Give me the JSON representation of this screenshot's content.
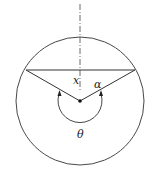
{
  "diagram": {
    "labels": {
      "x": "x",
      "alpha": "α",
      "theta": "θ"
    },
    "colors": {
      "stroke": "#333333",
      "background": "#ffffff"
    },
    "geometry": {
      "circle": {
        "cx": 80,
        "cy": 101,
        "r": 64
      },
      "chord": {
        "x1": 26,
        "y1": 70,
        "x2": 135,
        "y2": 70
      },
      "center_point": {
        "x": 80,
        "y": 101
      },
      "axis": {
        "x": 80,
        "y1": 4,
        "y2": 92
      },
      "theta_arc": {
        "start": [
          59,
          94
        ],
        "end": [
          101,
          94
        ],
        "radius": 30
      }
    }
  }
}
